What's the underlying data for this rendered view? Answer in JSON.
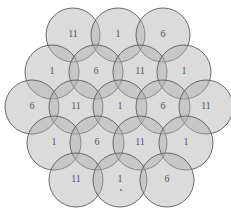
{
  "diagram": {
    "type": "hexagonal-cell-layout",
    "style": {
      "fill": "#b0b0b0",
      "fill_opacity": 0.45,
      "stroke": "#5a5a5a",
      "radius": 27
    },
    "cells": [
      {
        "row": 1,
        "x": 73,
        "y": 35,
        "label": "11"
      },
      {
        "row": 1,
        "x": 118,
        "y": 35,
        "label": "1"
      },
      {
        "row": 1,
        "x": 163,
        "y": 35,
        "label": "6"
      },
      {
        "row": 2,
        "x": 52,
        "y": 72,
        "label": "1"
      },
      {
        "row": 2,
        "x": 96,
        "y": 72,
        "label": "6"
      },
      {
        "row": 2,
        "x": 140,
        "y": 72,
        "label": "11"
      },
      {
        "row": 2,
        "x": 184,
        "y": 72,
        "label": "1"
      },
      {
        "row": 3,
        "x": 32,
        "y": 107,
        "label": "6"
      },
      {
        "row": 3,
        "x": 76,
        "y": 107,
        "label": "11"
      },
      {
        "row": 3,
        "x": 120,
        "y": 107,
        "label": "1"
      },
      {
        "row": 3,
        "x": 163,
        "y": 107,
        "label": "6"
      },
      {
        "row": 3,
        "x": 206,
        "y": 107,
        "label": "11"
      },
      {
        "row": 4,
        "x": 54,
        "y": 143,
        "label": "1"
      },
      {
        "row": 4,
        "x": 97,
        "y": 143,
        "label": "6"
      },
      {
        "row": 4,
        "x": 140,
        "y": 143,
        "label": "11"
      },
      {
        "row": 4,
        "x": 186,
        "y": 143,
        "label": "1"
      },
      {
        "row": 5,
        "x": 76,
        "y": 180,
        "label": "11"
      },
      {
        "row": 5,
        "x": 120,
        "y": 180,
        "label": "1"
      },
      {
        "row": 5,
        "x": 167,
        "y": 180,
        "label": "6"
      }
    ]
  }
}
